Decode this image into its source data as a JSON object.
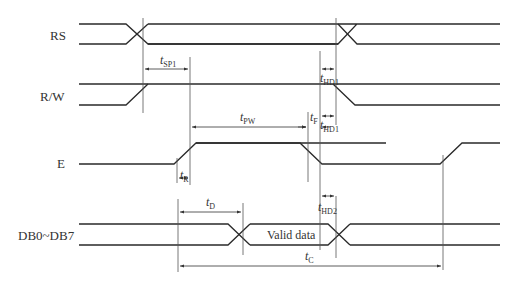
{
  "diagram": {
    "type": "timing-diagram",
    "signals": [
      {
        "name": "RS",
        "label": "RS"
      },
      {
        "name": "R/W",
        "label": "R/W"
      },
      {
        "name": "E",
        "label": "E"
      },
      {
        "name": "DB0~DB7",
        "label": "DB0~DB7"
      }
    ],
    "data_bus_label": "Valid data",
    "timing_params": {
      "tSP1": {
        "t": "t",
        "sub": "SP1"
      },
      "tHD1_top": {
        "t": "t",
        "sub": "HD1"
      },
      "tPW": {
        "t": "t",
        "sub": "PW"
      },
      "tF": {
        "t": "t",
        "sub": "F"
      },
      "tHD1_bottom": {
        "t": "t",
        "sub": "HD1"
      },
      "tR": {
        "t": "t",
        "sub": "R"
      },
      "tD": {
        "t": "t",
        "sub": "D"
      },
      "tHD2": {
        "t": "t",
        "sub": "HD2"
      },
      "tC": {
        "t": "t",
        "sub": "C"
      }
    },
    "colors": {
      "line": "#2a2a2a",
      "background": "#ffffff"
    }
  }
}
